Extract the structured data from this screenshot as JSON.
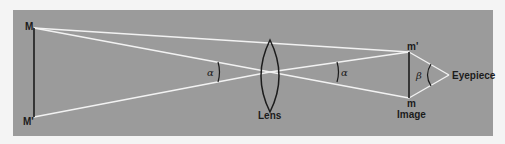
{
  "diagram": {
    "type": "optics-ray-diagram",
    "colors": {
      "background": "#f4f4f4",
      "panel": "#9b9b9b",
      "ray": "#f2f2f2",
      "ink": "#1c1c1c"
    },
    "labels": {
      "object_top": "M",
      "object_bottom": "M'",
      "lens": "Lens",
      "image_top": "m'",
      "image_bottom": "m",
      "image": "Image",
      "eyepiece": "Eyepiece",
      "angle_left": "α",
      "angle_right": "α",
      "angle_eyepiece": "β"
    }
  }
}
